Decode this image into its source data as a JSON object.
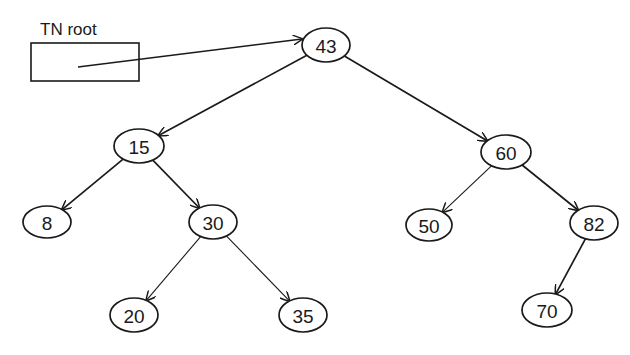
{
  "diagram": {
    "type": "binary-search-tree",
    "pointer": {
      "label": "TN root",
      "target": "43"
    },
    "nodes": [
      {
        "id": "43",
        "label": "43",
        "cx": 326,
        "cy": 45,
        "rx": 24,
        "ry": 17
      },
      {
        "id": "15",
        "label": "15",
        "cx": 139,
        "cy": 146,
        "rx": 25,
        "ry": 17
      },
      {
        "id": "60",
        "label": "60",
        "cx": 506,
        "cy": 152,
        "rx": 25,
        "ry": 17
      },
      {
        "id": "8",
        "label": "8",
        "cx": 47,
        "cy": 222,
        "rx": 24,
        "ry": 16
      },
      {
        "id": "30",
        "label": "30",
        "cx": 213,
        "cy": 222,
        "rx": 24,
        "ry": 17
      },
      {
        "id": "50",
        "label": "50",
        "cx": 429,
        "cy": 225,
        "rx": 23,
        "ry": 16
      },
      {
        "id": "82",
        "label": "82",
        "cx": 594,
        "cy": 223,
        "rx": 24,
        "ry": 17
      },
      {
        "id": "20",
        "label": "20",
        "cx": 134,
        "cy": 315,
        "rx": 24,
        "ry": 17
      },
      {
        "id": "35",
        "label": "35",
        "cx": 303,
        "cy": 315,
        "rx": 24,
        "ry": 17
      },
      {
        "id": "70",
        "label": "70",
        "cx": 547,
        "cy": 310,
        "rx": 25,
        "ry": 17
      }
    ],
    "edges": [
      {
        "from": "43",
        "to": "15"
      },
      {
        "from": "43",
        "to": "60"
      },
      {
        "from": "15",
        "to": "8"
      },
      {
        "from": "15",
        "to": "30"
      },
      {
        "from": "30",
        "to": "20"
      },
      {
        "from": "30",
        "to": "35"
      },
      {
        "from": "60",
        "to": "50"
      },
      {
        "from": "60",
        "to": "82"
      },
      {
        "from": "82",
        "to": "70"
      }
    ]
  }
}
